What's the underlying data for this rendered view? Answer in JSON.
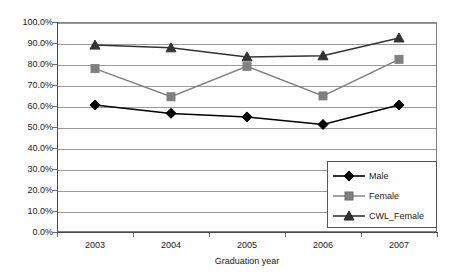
{
  "chart_data": {
    "type": "line",
    "title": "",
    "xlabel": "Graduation year",
    "ylabel": "",
    "categories": [
      "2003",
      "2004",
      "2005",
      "2006",
      "2007"
    ],
    "series": [
      {
        "name": "Male",
        "marker": "diamond",
        "color": "#000000",
        "values": [
          60.5,
          56.5,
          54.8,
          51.2,
          60.5
        ]
      },
      {
        "name": "Female",
        "marker": "square",
        "color": "#808080",
        "values": [
          77.8,
          64.4,
          78.9,
          64.8,
          82.2
        ]
      },
      {
        "name": "CWL_Female",
        "marker": "triangle",
        "color": "#333333",
        "values": [
          89.0,
          87.7,
          83.4,
          83.9,
          92.4
        ]
      }
    ],
    "ylim": [
      0,
      100
    ],
    "ytick_labels": [
      "0.0%",
      "10.0%",
      "20.0%",
      "30.0%",
      "40.0%",
      "50.0%",
      "60.0%",
      "70.0%",
      "80.0%",
      "90.0%",
      "100.0%"
    ],
    "ytick_values": [
      0,
      10,
      20,
      30,
      40,
      50,
      60,
      70,
      80,
      90,
      100
    ],
    "grid": true,
    "legend_position": "bottom-right",
    "colors": {
      "male": "#000000",
      "female": "#808080",
      "cwl_female": "#333333",
      "gridline": "#9a9a9a",
      "axis": "#4a4a4a",
      "plot_border": "#808080",
      "background": "#ffffff"
    }
  },
  "legend": {
    "entries": [
      {
        "label": "Male"
      },
      {
        "label": "Female"
      },
      {
        "label": "CWL_Female"
      }
    ]
  },
  "axes": {
    "x_title": "Graduation year"
  }
}
